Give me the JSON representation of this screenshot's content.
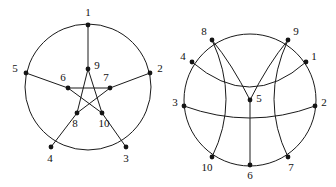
{
  "figure": {
    "background_color": "#ffffff",
    "stroke_color": "#1a1a1a",
    "node_color": "#151515",
    "label_color": "#111111",
    "width": 336,
    "height": 187
  },
  "left_figure": {
    "name": "pentagram-in-circle",
    "description": "Petersen-style drawing: outer circle carries vertices 1-5, inner pentagram carries vertices 6-10",
    "circle": {
      "cx": 88,
      "cy": 87,
      "r": 63
    },
    "nodes": [
      {
        "id": "1",
        "label": "1",
        "x": 88,
        "y": 25,
        "label_x": 88,
        "label_y": 13,
        "ring": "outer"
      },
      {
        "id": "2",
        "label": "2",
        "x": 150,
        "y": 73,
        "label_x": 160,
        "label_y": 69,
        "ring": "outer"
      },
      {
        "id": "3",
        "label": "3",
        "x": 126,
        "y": 147,
        "label_x": 126,
        "label_y": 159,
        "ring": "outer"
      },
      {
        "id": "4",
        "label": "4",
        "x": 51,
        "y": 147,
        "label_x": 50,
        "label_y": 159,
        "ring": "outer"
      },
      {
        "id": "5",
        "label": "5",
        "x": 26,
        "y": 73,
        "label_x": 15,
        "label_y": 69,
        "ring": "outer"
      },
      {
        "id": "6",
        "label": "6",
        "x": 68,
        "y": 88,
        "label_x": 63,
        "label_y": 78,
        "ring": "inner"
      },
      {
        "id": "7",
        "label": "7",
        "x": 110,
        "y": 88,
        "label_x": 106,
        "label_y": 78,
        "ring": "inner"
      },
      {
        "id": "8",
        "label": "8",
        "x": 77,
        "y": 113,
        "label_x": 75,
        "label_y": 124,
        "ring": "inner"
      },
      {
        "id": "9",
        "label": "9",
        "x": 88,
        "y": 69,
        "label_x": 97,
        "label_y": 66,
        "ring": "inner"
      },
      {
        "id": "10",
        "label": "10",
        "x": 102,
        "y": 113,
        "label_x": 104,
        "label_y": 124,
        "ring": "inner"
      }
    ],
    "spokes": [
      {
        "from": "1",
        "to": "9"
      },
      {
        "from": "2",
        "to": "7"
      },
      {
        "from": "3",
        "to": "10"
      },
      {
        "from": "4",
        "to": "8"
      },
      {
        "from": "5",
        "to": "6"
      }
    ],
    "pentagram_edges": [
      {
        "from": "6",
        "to": "7"
      },
      {
        "from": "7",
        "to": "8"
      },
      {
        "from": "8",
        "to": "9"
      },
      {
        "from": "9",
        "to": "10"
      },
      {
        "from": "10",
        "to": "6"
      }
    ],
    "outer_arcs": [
      {
        "from": "1",
        "to": "2"
      },
      {
        "from": "2",
        "to": "3"
      },
      {
        "from": "3",
        "to": "4"
      },
      {
        "from": "4",
        "to": "5"
      },
      {
        "from": "5",
        "to": "1"
      }
    ]
  },
  "right_figure": {
    "name": "sphere-embedding",
    "description": "Same graph drawn on a sphere: three great-circle arcs meet at the central vertex 5",
    "circle": {
      "cx": 250,
      "cy": 100,
      "r": 66
    },
    "nodes": [
      {
        "id": "1",
        "label": "1",
        "x": 306,
        "y": 62,
        "label_x": 314,
        "label_y": 57
      },
      {
        "id": "2",
        "label": "2",
        "x": 315,
        "y": 106,
        "label_x": 324,
        "label_y": 103
      },
      {
        "id": "3",
        "label": "3",
        "x": 184,
        "y": 106,
        "label_x": 175,
        "label_y": 103
      },
      {
        "id": "4",
        "label": "4",
        "x": 192,
        "y": 62,
        "label_x": 183,
        "label_y": 57
      },
      {
        "id": "5",
        "label": "5",
        "x": 250,
        "y": 100,
        "label_x": 259,
        "label_y": 99
      },
      {
        "id": "6",
        "label": "6",
        "x": 250,
        "y": 165,
        "label_x": 250,
        "label_y": 176
      },
      {
        "id": "7",
        "label": "7",
        "x": 288,
        "y": 157,
        "label_x": 291,
        "label_y": 168
      },
      {
        "id": "8",
        "label": "8",
        "x": 212,
        "y": 40,
        "label_x": 204,
        "label_y": 32
      },
      {
        "id": "9",
        "label": "9",
        "x": 288,
        "y": 40,
        "label_x": 296,
        "label_y": 32
      },
      {
        "id": "10",
        "label": "10",
        "x": 212,
        "y": 157,
        "label_x": 207,
        "label_y": 168
      }
    ]
  }
}
